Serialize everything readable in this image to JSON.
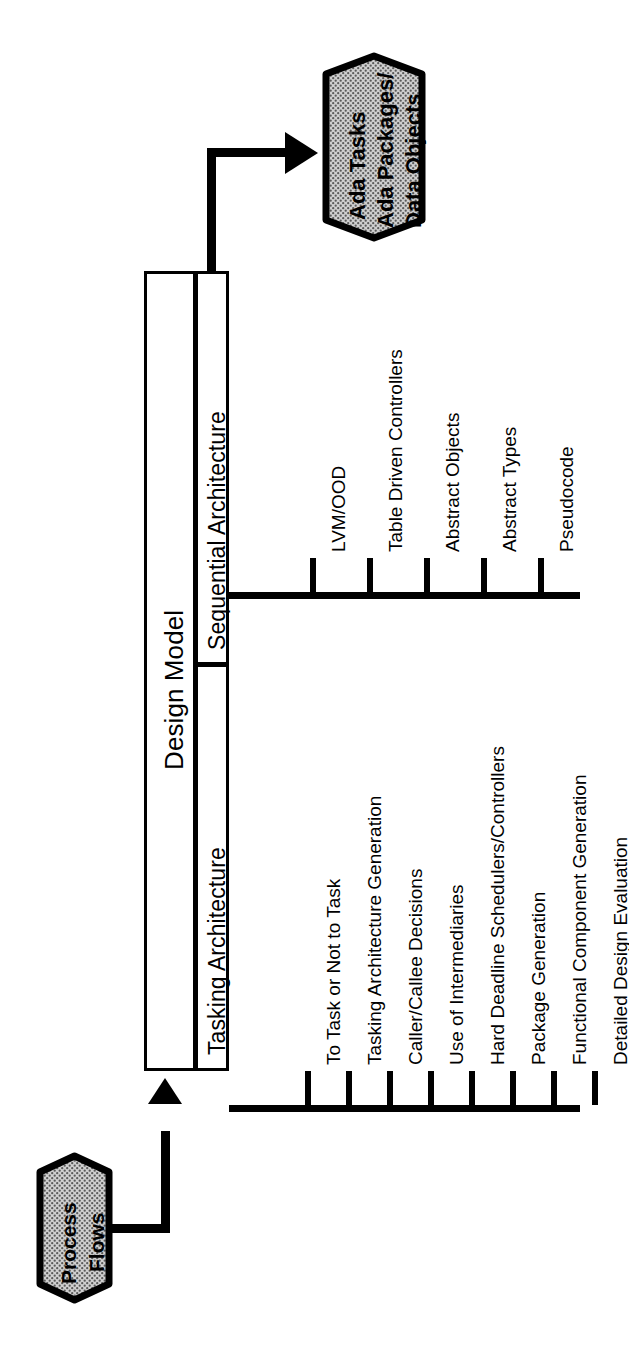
{
  "diagram": {
    "title": "Design Model",
    "orientation": "rotated-90-counterclockwise",
    "input": {
      "name": "process-flows",
      "shape": "cylinder",
      "fill": "hatched-gray",
      "lines": [
        "Process",
        "Flows"
      ]
    },
    "output": {
      "name": "ada-products",
      "shape": "cylinder",
      "fill": "hatched-gray",
      "lines": [
        "Ada Tasks",
        "Ada Packages/",
        "Data Objects"
      ]
    },
    "root": {
      "label": "Design Model"
    },
    "branches": [
      {
        "id": "sequential",
        "label": "Sequential Architecture",
        "leaves": [
          "LVM/OOD",
          "Table Driven Controllers",
          "Abstract Objects",
          "Abstract Types",
          "Pseudocode"
        ]
      },
      {
        "id": "tasking",
        "label": "Tasking Architecture",
        "leaves": [
          "To Task or Not to Task",
          "Tasking Architecture Generation",
          "Caller/Callee Decisions",
          "Use of Intermediaries",
          "Hard Deadline Schedulers/Controllers",
          "Package Generation",
          "Functional Component Generation",
          "Detailed Design Evaluation"
        ]
      }
    ],
    "colors": {
      "stroke": "#000000",
      "background": "#ffffff",
      "cylinder_fill": "#b9b9b9",
      "cylinder_pattern": "#4a4a4a"
    }
  }
}
